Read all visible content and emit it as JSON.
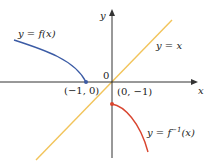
{
  "diagram": {
    "axes": {
      "x_label": "x",
      "y_label": "y",
      "origin_label": "0",
      "axis_color": "#333333"
    },
    "curves": [
      {
        "name": "f",
        "label_prefix": "y = ",
        "label_func": "f(x)",
        "color": "#3b5ba5",
        "endpoint_label": "(−1, 0)"
      },
      {
        "name": "f-inverse",
        "label_prefix": "y = ",
        "label_func_base": "f",
        "label_func_sup": "−1",
        "label_func_arg": "(x)",
        "color": "#d9452f",
        "endpoint_label": "(0, −1)"
      },
      {
        "name": "identity",
        "label": "y = x",
        "color": "#f2c45a"
      }
    ]
  }
}
